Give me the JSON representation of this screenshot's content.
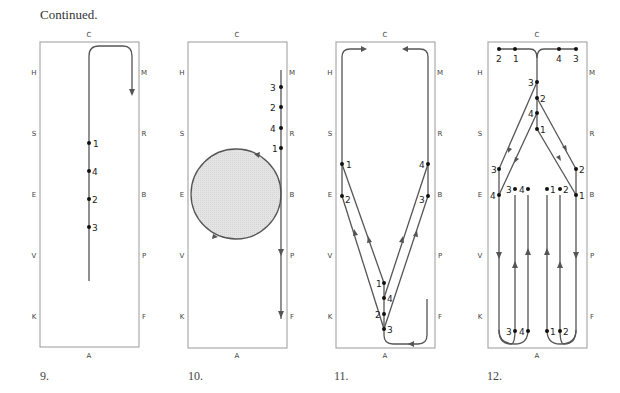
{
  "heading": "Continued.",
  "arena_letters": {
    "top": "C",
    "bottom": "A",
    "left": [
      "H",
      "S",
      "E",
      "V",
      "K"
    ],
    "right": [
      "M",
      "R",
      "B",
      "P",
      "F"
    ]
  },
  "diagrams": [
    {
      "caption": "9.",
      "markers": [
        "1",
        "4",
        "2",
        "3"
      ]
    },
    {
      "caption": "10.",
      "markers": [
        "3",
        "2",
        "4",
        "1"
      ]
    },
    {
      "caption": "11.",
      "markers_left": [
        "1",
        "2"
      ],
      "markers_right": [
        "4",
        "3"
      ],
      "markers_center": [
        "1",
        "4",
        "2",
        "3"
      ]
    },
    {
      "caption": "12.",
      "markers_top": [
        "2",
        "1",
        "4",
        "3"
      ],
      "markers_center": [
        "3",
        "2",
        "4",
        "1"
      ],
      "markers_side_left": [
        "3",
        "4"
      ],
      "markers_side_right": [
        "2",
        "1"
      ],
      "markers_row_e": [
        "3",
        "4",
        "1",
        "2"
      ],
      "markers_bottom": [
        "3",
        "4",
        "1",
        "2"
      ]
    }
  ],
  "colors": {
    "line": "#555555",
    "box": "#999999",
    "circle_fill": "#e2e2e2"
  }
}
